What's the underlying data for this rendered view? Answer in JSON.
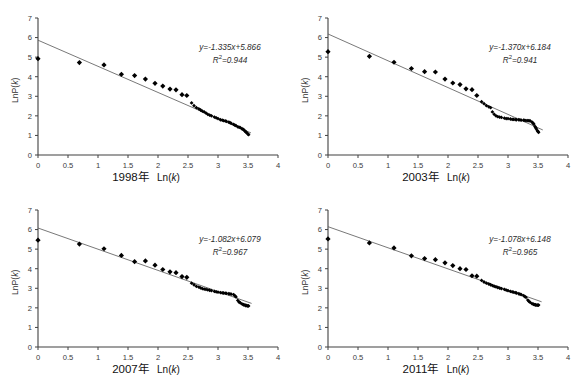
{
  "figure": {
    "background": "#ffffff",
    "marker_color": "#000000",
    "line_color": "#555555",
    "axis_color": "#404040"
  },
  "axes": {
    "x_ticks": [
      "0",
      "0.5",
      "1",
      "1.5",
      "2",
      "2.5",
      "3",
      "3.5",
      "4"
    ],
    "y_ticks": [
      "0",
      "1",
      "2",
      "3",
      "4",
      "5",
      "6",
      "7"
    ],
    "ylabel_pre": "LnP(",
    "ylabel_var": "k",
    "ylabel_post": ")",
    "xlabel_prefix": "Ln(",
    "xlabel_var": "k",
    "xlabel_suffix": ")"
  },
  "chart_data": [
    {
      "type": "scatter",
      "title": "1998年",
      "xlabel": "1998年   Ln(k)",
      "ylabel": "LnP(k)",
      "xlim": [
        0,
        4
      ],
      "ylim": [
        0,
        7
      ],
      "xticks": [
        0,
        0.5,
        1,
        1.5,
        2,
        2.5,
        3,
        3.5,
        4
      ],
      "yticks": [
        0,
        1,
        2,
        3,
        4,
        5,
        6,
        7
      ],
      "grid": false,
      "legend": "none",
      "annotation_equation": "y=-1.335x+5.866",
      "annotation_r2": "R²=0.944",
      "fit": {
        "slope": -1.335,
        "intercept": 5.866,
        "r2": 0.944,
        "x_start": 0,
        "x_end": 3.55
      },
      "points": [
        [
          0.0,
          4.92
        ],
        [
          0.69,
          4.72
        ],
        [
          1.1,
          4.6
        ],
        [
          1.39,
          4.12
        ],
        [
          1.61,
          4.06
        ],
        [
          1.79,
          3.88
        ],
        [
          1.95,
          3.66
        ],
        [
          2.08,
          3.52
        ],
        [
          2.2,
          3.37
        ],
        [
          2.3,
          3.33
        ],
        [
          2.4,
          3.08
        ],
        [
          2.48,
          3.04
        ],
        [
          2.56,
          2.66
        ],
        [
          2.64,
          2.42
        ],
        [
          2.71,
          2.3
        ],
        [
          2.77,
          2.2
        ],
        [
          2.83,
          2.08
        ],
        [
          2.89,
          2.0
        ],
        [
          2.94,
          1.94
        ],
        [
          3.0,
          1.86
        ],
        [
          3.04,
          1.8
        ],
        [
          3.09,
          1.76
        ],
        [
          3.14,
          1.72
        ],
        [
          3.18,
          1.68
        ],
        [
          3.22,
          1.62
        ],
        [
          3.26,
          1.56
        ],
        [
          3.3,
          1.5
        ],
        [
          3.33,
          1.44
        ],
        [
          3.37,
          1.4
        ],
        [
          3.4,
          1.34
        ],
        [
          3.43,
          1.28
        ],
        [
          3.45,
          1.22
        ],
        [
          3.47,
          1.16
        ],
        [
          3.49,
          1.1
        ],
        [
          3.51,
          1.04
        ],
        [
          2.6,
          2.52
        ],
        [
          2.68,
          2.36
        ],
        [
          2.74,
          2.24
        ],
        [
          2.8,
          2.14
        ],
        [
          2.86,
          2.04
        ],
        [
          2.97,
          1.9
        ],
        [
          3.07,
          1.78
        ],
        [
          3.12,
          1.74
        ],
        [
          3.2,
          1.65
        ],
        [
          3.28,
          1.53
        ],
        [
          3.35,
          1.42
        ],
        [
          3.42,
          1.31
        ],
        [
          3.46,
          1.19
        ],
        [
          3.5,
          1.07
        ]
      ]
    },
    {
      "type": "scatter",
      "title": "2003年",
      "xlabel": "2003年   Ln(k)",
      "ylabel": "LnP(k)",
      "xlim": [
        0,
        4
      ],
      "ylim": [
        0,
        7
      ],
      "xticks": [
        0,
        0.5,
        1,
        1.5,
        2,
        2.5,
        3,
        3.5,
        4
      ],
      "yticks": [
        0,
        1,
        2,
        3,
        4,
        5,
        6,
        7
      ],
      "grid": false,
      "legend": "none",
      "annotation_equation": "y=-1.370x+6.184",
      "annotation_r2": "R²=0.941",
      "fit": {
        "slope": -1.37,
        "intercept": 6.184,
        "r2": 0.941,
        "x_start": 0,
        "x_end": 3.58
      },
      "points": [
        [
          0.0,
          5.28
        ],
        [
          0.69,
          5.04
        ],
        [
          1.1,
          4.74
        ],
        [
          1.39,
          4.42
        ],
        [
          1.61,
          4.26
        ],
        [
          1.79,
          4.24
        ],
        [
          1.95,
          3.88
        ],
        [
          2.08,
          3.68
        ],
        [
          2.2,
          3.6
        ],
        [
          2.3,
          3.38
        ],
        [
          2.4,
          3.34
        ],
        [
          2.48,
          3.04
        ],
        [
          2.56,
          2.72
        ],
        [
          2.64,
          2.52
        ],
        [
          2.71,
          2.42
        ],
        [
          2.77,
          2.08
        ],
        [
          2.83,
          1.96
        ],
        [
          2.89,
          1.92
        ],
        [
          2.94,
          1.88
        ],
        [
          3.0,
          1.86
        ],
        [
          3.04,
          1.84
        ],
        [
          3.09,
          1.82
        ],
        [
          3.14,
          1.8
        ],
        [
          3.18,
          1.8
        ],
        [
          3.22,
          1.78
        ],
        [
          3.26,
          1.78
        ],
        [
          3.3,
          1.76
        ],
        [
          3.33,
          1.76
        ],
        [
          3.37,
          1.74
        ],
        [
          3.4,
          1.68
        ],
        [
          3.43,
          1.58
        ],
        [
          3.45,
          1.46
        ],
        [
          3.47,
          1.34
        ],
        [
          3.49,
          1.24
        ],
        [
          3.51,
          1.16
        ],
        [
          2.6,
          2.62
        ],
        [
          2.68,
          2.46
        ],
        [
          2.74,
          2.2
        ],
        [
          2.8,
          2.0
        ],
        [
          2.86,
          1.94
        ],
        [
          2.97,
          1.86
        ],
        [
          3.07,
          1.82
        ],
        [
          3.12,
          1.81
        ],
        [
          3.2,
          1.79
        ],
        [
          3.28,
          1.77
        ],
        [
          3.35,
          1.75
        ],
        [
          3.42,
          1.62
        ],
        [
          3.46,
          1.4
        ],
        [
          3.5,
          1.2
        ]
      ]
    },
    {
      "type": "scatter",
      "title": "2007年",
      "xlabel": "2007年   Ln(k)",
      "ylabel": "LnP(k)",
      "xlim": [
        0,
        4
      ],
      "ylim": [
        0,
        7
      ],
      "xticks": [
        0,
        0.5,
        1,
        1.5,
        2,
        2.5,
        3,
        3.5,
        4
      ],
      "yticks": [
        0,
        1,
        2,
        3,
        4,
        5,
        6,
        7
      ],
      "grid": false,
      "legend": "none",
      "annotation_equation": "y=-1.082x+6.079",
      "annotation_r2": "R²=0.967",
      "fit": {
        "slope": -1.082,
        "intercept": 6.079,
        "r2": 0.967,
        "x_start": 0,
        "x_end": 3.56
      },
      "points": [
        [
          0.0,
          5.46
        ],
        [
          0.69,
          5.26
        ],
        [
          1.1,
          5.02
        ],
        [
          1.39,
          4.68
        ],
        [
          1.61,
          4.36
        ],
        [
          1.79,
          4.4
        ],
        [
          1.95,
          4.18
        ],
        [
          2.08,
          3.96
        ],
        [
          2.2,
          3.84
        ],
        [
          2.3,
          3.8
        ],
        [
          2.4,
          3.6
        ],
        [
          2.48,
          3.56
        ],
        [
          2.56,
          3.26
        ],
        [
          2.64,
          3.1
        ],
        [
          2.71,
          3.02
        ],
        [
          2.77,
          2.96
        ],
        [
          2.83,
          2.92
        ],
        [
          2.89,
          2.88
        ],
        [
          2.94,
          2.84
        ],
        [
          3.0,
          2.8
        ],
        [
          3.04,
          2.78
        ],
        [
          3.09,
          2.76
        ],
        [
          3.14,
          2.74
        ],
        [
          3.18,
          2.72
        ],
        [
          3.22,
          2.7
        ],
        [
          3.26,
          2.68
        ],
        [
          3.3,
          2.56
        ],
        [
          3.33,
          2.38
        ],
        [
          3.37,
          2.26
        ],
        [
          3.4,
          2.2
        ],
        [
          3.43,
          2.16
        ],
        [
          3.45,
          2.14
        ],
        [
          3.47,
          2.12
        ],
        [
          3.49,
          2.1
        ],
        [
          3.51,
          2.1
        ],
        [
          2.6,
          3.18
        ],
        [
          2.68,
          3.06
        ],
        [
          2.74,
          2.98
        ],
        [
          2.8,
          2.94
        ],
        [
          2.86,
          2.9
        ],
        [
          2.97,
          2.82
        ],
        [
          3.07,
          2.77
        ],
        [
          3.12,
          2.75
        ],
        [
          3.2,
          2.71
        ],
        [
          3.28,
          2.62
        ],
        [
          3.35,
          2.3
        ],
        [
          3.42,
          2.17
        ],
        [
          3.46,
          2.12
        ],
        [
          3.5,
          2.1
        ]
      ]
    },
    {
      "type": "scatter",
      "title": "2011年",
      "xlabel": "2011年   Ln(k)",
      "ylabel": "LnP(k)",
      "xlim": [
        0,
        4
      ],
      "ylim": [
        0,
        7
      ],
      "xticks": [
        0,
        0.5,
        1,
        1.5,
        2,
        2.5,
        3,
        3.5,
        4
      ],
      "yticks": [
        0,
        1,
        2,
        3,
        4,
        5,
        6,
        7
      ],
      "grid": false,
      "legend": "none",
      "annotation_equation": "y=-1.078x+6.148",
      "annotation_r2": "R²=0.965",
      "fit": {
        "slope": -1.078,
        "intercept": 6.148,
        "r2": 0.965,
        "x_start": 0,
        "x_end": 3.56
      },
      "points": [
        [
          0.0,
          5.52
        ],
        [
          0.69,
          5.32
        ],
        [
          1.1,
          5.06
        ],
        [
          1.39,
          4.66
        ],
        [
          1.61,
          4.52
        ],
        [
          1.79,
          4.46
        ],
        [
          1.95,
          4.3
        ],
        [
          2.08,
          4.16
        ],
        [
          2.2,
          4.0
        ],
        [
          2.3,
          3.96
        ],
        [
          2.4,
          3.64
        ],
        [
          2.48,
          3.62
        ],
        [
          2.56,
          3.4
        ],
        [
          2.64,
          3.26
        ],
        [
          2.71,
          3.18
        ],
        [
          2.77,
          3.1
        ],
        [
          2.83,
          3.04
        ],
        [
          2.89,
          2.98
        ],
        [
          2.94,
          2.94
        ],
        [
          3.0,
          2.88
        ],
        [
          3.04,
          2.84
        ],
        [
          3.09,
          2.8
        ],
        [
          3.14,
          2.76
        ],
        [
          3.18,
          2.72
        ],
        [
          3.22,
          2.68
        ],
        [
          3.26,
          2.62
        ],
        [
          3.3,
          2.54
        ],
        [
          3.33,
          2.4
        ],
        [
          3.37,
          2.28
        ],
        [
          3.4,
          2.22
        ],
        [
          3.43,
          2.18
        ],
        [
          3.45,
          2.16
        ],
        [
          3.47,
          2.14
        ],
        [
          3.49,
          2.14
        ],
        [
          3.51,
          2.14
        ],
        [
          2.6,
          3.32
        ],
        [
          2.68,
          3.22
        ],
        [
          2.74,
          3.14
        ],
        [
          2.8,
          3.07
        ],
        [
          2.86,
          3.01
        ],
        [
          2.97,
          2.91
        ],
        [
          3.07,
          2.82
        ],
        [
          3.12,
          2.78
        ],
        [
          3.2,
          2.7
        ],
        [
          3.28,
          2.58
        ],
        [
          3.35,
          2.33
        ],
        [
          3.42,
          2.19
        ],
        [
          3.46,
          2.15
        ],
        [
          3.5,
          2.14
        ]
      ]
    }
  ]
}
